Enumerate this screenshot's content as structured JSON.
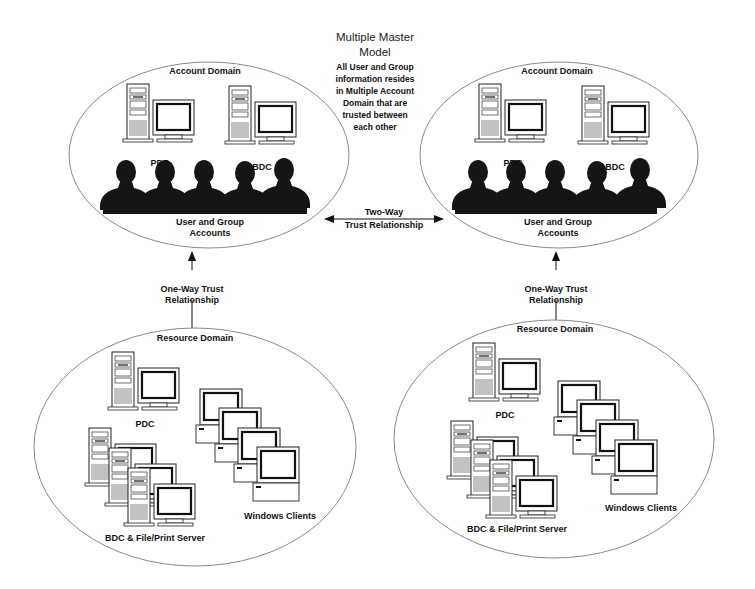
{
  "title": {
    "line1": "Multiple Master",
    "line2": "Model"
  },
  "description": {
    "lines": [
      "All User and Group",
      "information resides",
      "in Multiple Account",
      "Domain that are",
      "trusted between",
      "each other"
    ]
  },
  "account_domains": [
    {
      "label": "Account Domain",
      "servers": [
        "PDC",
        "BDC"
      ],
      "users_label_line1": "User and Group",
      "users_label_line2": "Accounts"
    },
    {
      "label": "Account Domain",
      "servers": [
        "PDC",
        "BDC"
      ],
      "users_label_line1": "User and Group",
      "users_label_line2": "Accounts"
    }
  ],
  "two_way_trust": {
    "line1": "Two-Way",
    "line2": "Trust Relationship"
  },
  "one_way_trust": [
    {
      "line1": "One-Way Trust",
      "line2": "Relationship"
    },
    {
      "line1": "One-Way Trust",
      "line2": "Relationship"
    }
  ],
  "resource_domains": [
    {
      "label": "Resource Domain",
      "pdc_label": "PDC",
      "bdc_label": "BDC & File/Print Server",
      "clients_label": "Windows Clients"
    },
    {
      "label": "Resource Domain",
      "pdc_label": "PDC",
      "bdc_label": "BDC & File/Print Server",
      "clients_label": "Windows Clients"
    }
  ],
  "colors": {
    "ellipse_stroke": "#8a8a8a",
    "ink": "#111111",
    "silhouette": "#151515"
  }
}
